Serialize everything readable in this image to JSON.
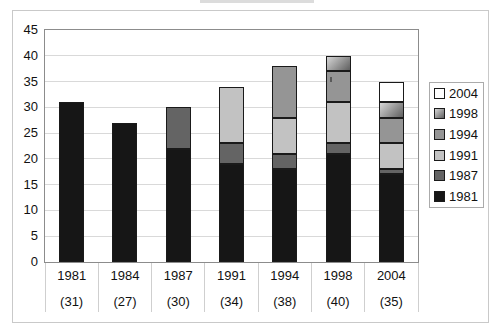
{
  "chart_data": {
    "type": "bar",
    "stacked": true,
    "categories": [
      "1981",
      "1984",
      "1987",
      "1991",
      "1994",
      "1998",
      "2004"
    ],
    "category_totals_labels": [
      "(31)",
      "(27)",
      "(30)",
      "(34)",
      "(38)",
      "(40)",
      "(35)"
    ],
    "totals": [
      31,
      27,
      30,
      34,
      38,
      40,
      35
    ],
    "series": [
      {
        "name": "1981",
        "color": "#161616",
        "values": [
          31,
          27,
          22,
          19,
          18,
          21,
          17
        ]
      },
      {
        "name": "1987",
        "color": "#646464",
        "values": [
          0,
          0,
          8,
          4,
          3,
          2,
          1
        ]
      },
      {
        "name": "1991",
        "color": "#c2c2c2",
        "values": [
          0,
          0,
          0,
          11,
          7,
          8,
          5
        ]
      },
      {
        "name": "1994",
        "color": "#959595",
        "values": [
          0,
          0,
          0,
          0,
          10,
          6,
          5
        ]
      },
      {
        "name": "1998",
        "gradient": [
          "#d6d6d6",
          "#5f5f5f"
        ],
        "values": [
          0,
          0,
          0,
          0,
          0,
          3,
          3
        ]
      },
      {
        "name": "2004",
        "color": "#ffffff",
        "values": [
          0,
          0,
          0,
          0,
          0,
          0,
          4
        ]
      }
    ],
    "legend": {
      "position": "right",
      "entries": [
        "2004",
        "1998",
        "1994",
        "1991",
        "1987",
        "1981"
      ]
    },
    "y_axis": {
      "min": 0,
      "max": 45,
      "step": 5,
      "tick_labels": [
        "0",
        "5",
        "10",
        "15",
        "20",
        "25",
        "30",
        "35",
        "40",
        "45"
      ]
    },
    "grid": true
  },
  "style_colors": {
    "background": "#ffffff",
    "outer_border": "#c9c9c9",
    "plot_border": "#8c8c8c",
    "gridline": "#d9d9d9",
    "segment_outline": "#1a1a1a",
    "text": "#111111"
  }
}
